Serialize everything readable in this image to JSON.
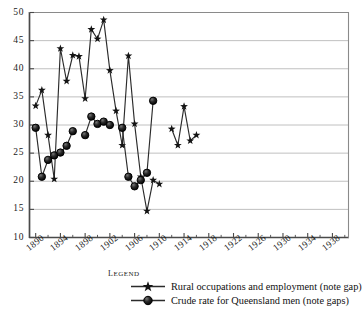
{
  "chart_data": {
    "type": "line",
    "title": "",
    "xlabel": "",
    "ylabel": "",
    "xlim": [
      1889,
      1940
    ],
    "ylim": [
      10,
      50
    ],
    "grid": true,
    "xticks": [
      "1890",
      "1894",
      "1898",
      "1902",
      "1906",
      "1910",
      "1914",
      "1918",
      "1922",
      "1926",
      "1930",
      "1934",
      "1938"
    ],
    "yticks": [
      "10",
      "15",
      "20",
      "25",
      "30",
      "35",
      "40",
      "45",
      "50"
    ],
    "legend_position": "below-axes",
    "series": [
      {
        "name": "Rural occupations and employment (note gap)",
        "marker": "star",
        "note": "note gap",
        "segments": [
          {
            "x": [
              1890,
              1891,
              1892,
              1893,
              1894,
              1895,
              1896,
              1897,
              1898,
              1899,
              1900,
              1901,
              1902,
              1903,
              1904,
              1905,
              1906,
              1907,
              1908,
              1909,
              1910,
              1911,
              1912,
              1913,
              1914,
              1915,
              1916,
              1917,
              1918,
              1919,
              1920,
              1921,
              1922,
              1923,
              1924,
              1925,
              1926,
              1927,
              1928
            ],
            "y": [
              33.4,
              36.2,
              28.2,
              20.4,
              43.6,
              37.8,
              42.4,
              42.2,
              34.7,
              47.0,
              45.3,
              48.7,
              39.7,
              32.5,
              26.4,
              42.3,
              30.2,
              20.8,
              14.7,
              20.2,
              19.5,
              29.3,
              26.4,
              33.3,
              27.2,
              28.2,
              31.0,
              29.0,
              28.0
            ]
          }
        ],
        "points": [
          {
            "x": 1890,
            "y": 33.4
          },
          {
            "x": 1891,
            "y": 36.2
          },
          {
            "x": 1892,
            "y": 28.2
          },
          {
            "x": 1893,
            "y": 20.4
          },
          {
            "x": 1894,
            "y": 43.6
          },
          {
            "x": 1895,
            "y": 37.8
          },
          {
            "x": 1896,
            "y": 42.4
          },
          {
            "x": 1897,
            "y": 42.2
          },
          {
            "x": 1898,
            "y": 34.7
          },
          {
            "x": 1899,
            "y": 47.0
          },
          {
            "x": 1900,
            "y": 45.3
          },
          {
            "x": 1901,
            "y": 48.7
          },
          {
            "x": 1902,
            "y": 39.7
          },
          {
            "x": 1903,
            "y": 32.5
          },
          {
            "x": 1904,
            "y": 26.4
          },
          {
            "x": 1905,
            "y": 42.3
          },
          {
            "x": 1906,
            "y": 30.2
          },
          {
            "x": 1907,
            "y": 20.8
          },
          {
            "x": 1908,
            "y": 14.7
          },
          {
            "x": 1909,
            "y": 20.2
          },
          {
            "x": 1910,
            "y": 19.5
          },
          {
            "x": 1911,
            "y": 29.3
          },
          {
            "x": 1912,
            "y": 26.4
          },
          {
            "x": 1913,
            "y": 33.3
          },
          {
            "x": 1914,
            "y": 27.2
          },
          {
            "x": 1915,
            "y": 28.2
          }
        ]
      },
      {
        "name": "Crude rate for Queensland men (note gaps)",
        "marker": "circle",
        "note": "note gaps",
        "gaps": 2
      }
    ],
    "star_series_plot": [
      {
        "x": 1890,
        "y": 33.4
      },
      {
        "x": 1891,
        "y": 36.2
      },
      {
        "x": 1892,
        "y": 28.2
      },
      {
        "x": 1893,
        "y": 20.4
      },
      {
        "x": 1894,
        "y": 43.6
      },
      {
        "x": 1895,
        "y": 37.8
      },
      {
        "x": 1896,
        "y": 42.4
      },
      {
        "x": 1897,
        "y": 42.2
      },
      {
        "x": 1898,
        "y": 34.7
      },
      {
        "x": 1899,
        "y": 47.0
      },
      {
        "x": 1900,
        "y": 45.3
      },
      {
        "x": 1901,
        "y": 48.7
      },
      {
        "x": 1902,
        "y": 39.7
      },
      {
        "x": 1903,
        "y": 32.5
      },
      {
        "x": 1904,
        "y": 26.4
      },
      {
        "x": 1905,
        "y": 42.3
      },
      {
        "x": 1906,
        "y": 30.2
      },
      {
        "x": 1907,
        "y": 20.8
      },
      {
        "x": 1908,
        "y": 14.7
      },
      {
        "x": 1909,
        "y": 20.2
      },
      {
        "x": 1910,
        "y": 19.5
      }
    ],
    "star_series_plot_2": [
      {
        "x": 1912,
        "y": 29.3
      },
      {
        "x": 1913,
        "y": 26.4
      },
      {
        "x": 1914,
        "y": 33.3
      },
      {
        "x": 1915,
        "y": 27.2
      },
      {
        "x": 1916,
        "y": 28.2
      }
    ],
    "circle_series_plot_1": [
      {
        "x": 1890,
        "y": 29.5
      },
      {
        "x": 1891,
        "y": 20.8
      },
      {
        "x": 1892,
        "y": 23.8
      },
      {
        "x": 1893,
        "y": 24.6
      },
      {
        "x": 1894,
        "y": 25.1
      },
      {
        "x": 1895,
        "y": 26.3
      },
      {
        "x": 1896,
        "y": 28.9
      }
    ],
    "circle_series_plot_2": [
      {
        "x": 1898,
        "y": 28.2
      },
      {
        "x": 1899,
        "y": 31.5
      },
      {
        "x": 1900,
        "y": 30.2
      },
      {
        "x": 1901,
        "y": 30.6
      },
      {
        "x": 1902,
        "y": 30.0
      }
    ],
    "circle_series_plot_3": [
      {
        "x": 1904,
        "y": 29.5
      },
      {
        "x": 1905,
        "y": 20.8
      },
      {
        "x": 1906,
        "y": 19.1
      },
      {
        "x": 1907,
        "y": 20.2
      },
      {
        "x": 1908,
        "y": 21.5
      },
      {
        "x": 1909,
        "y": 34.3
      }
    ]
  },
  "axis": {
    "y_labels": [
      "50",
      "45",
      "40",
      "35",
      "30",
      "25",
      "20",
      "15",
      "10"
    ],
    "x_labels": [
      "1890",
      "1894",
      "1898",
      "1902",
      "1906",
      "1910",
      "1914",
      "1918",
      "1922",
      "1926",
      "1930",
      "1934",
      "1938"
    ]
  },
  "legend": {
    "title": "Legend",
    "entries": [
      {
        "marker": "star",
        "label": "Rural occupations and employment (note gap)"
      },
      {
        "marker": "circle",
        "label": "Crude rate for Queensland men (note gaps)"
      }
    ]
  },
  "colors": {
    "line": "#2b2b2b",
    "grid": "#b9b9b9",
    "axis": "#555555",
    "marker_fill": "#1c1c1c",
    "background": "#ffffff"
  }
}
